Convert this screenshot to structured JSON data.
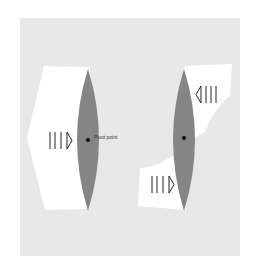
{
  "diagram": {
    "panels": [
      {
        "id": "left",
        "description": "Single force pushing lens at pivot",
        "arrows": [
          {
            "direction": "right",
            "label": ""
          }
        ],
        "pivot_label": "Pivot point"
      },
      {
        "id": "right",
        "description": "Opposing forces (couple) rotating lens about pivot",
        "arrows": [
          {
            "direction": "left",
            "position": "top"
          },
          {
            "direction": "right",
            "position": "bottom"
          }
        ],
        "pivot_label": ""
      }
    ],
    "pivot_label": "Pivot point"
  },
  "colors": {
    "background_panel": "#e8e8e8",
    "page": "#ffffff",
    "lens": "#858585",
    "white_shape": "#ffffff",
    "stroke": "#222222"
  }
}
